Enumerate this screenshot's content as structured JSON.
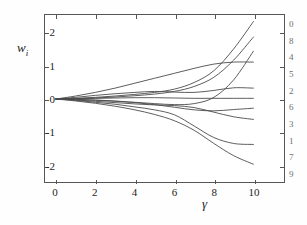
{
  "figure": {
    "background": "#ffffff",
    "frame_color": "#55565a",
    "curve_color": "#4a4a4a",
    "label_color": "#6d6e72"
  },
  "axes": {
    "x_title": "γ",
    "y_title_base": "w",
    "y_title_sub": "i",
    "x_ticks": [
      "0",
      "2",
      "4",
      "6",
      "8",
      "10"
    ],
    "x_tick_values": [
      0,
      2,
      4,
      6,
      8,
      10
    ],
    "y_ticks": [
      "2",
      "1",
      "0",
      "-1",
      "-2"
    ],
    "y_tick_values": [
      2,
      1,
      0,
      -1,
      -2
    ],
    "xlim": [
      -0.55,
      11.55
    ],
    "ylim": [
      -2.52,
      2.55
    ]
  },
  "chart_data": {
    "type": "line",
    "title": "",
    "xlabel": "γ",
    "ylabel": "w_i",
    "xlim": [
      -0.55,
      11.55
    ],
    "ylim": [
      -2.52,
      2.55
    ],
    "grid": false,
    "legend_position": "right-outside",
    "x": [
      0,
      1,
      2,
      3,
      4,
      5,
      6,
      7,
      8,
      9,
      10
    ],
    "series": [
      {
        "name": "0",
        "label": "0",
        "end_value": 2.35,
        "values": [
          0.0,
          0.02,
          0.05,
          0.09,
          0.14,
          0.2,
          0.3,
          0.5,
          0.86,
          1.52,
          2.35
        ]
      },
      {
        "name": "8",
        "label": "8",
        "end_value": 1.88,
        "values": [
          0.0,
          0.01,
          0.03,
          0.06,
          0.1,
          0.15,
          0.23,
          0.38,
          0.66,
          1.18,
          1.88
        ]
      },
      {
        "name": "4",
        "label": "4",
        "end_value": 1.45,
        "values": [
          0.0,
          -0.01,
          -0.03,
          -0.06,
          -0.1,
          -0.14,
          -0.17,
          -0.14,
          0.05,
          0.58,
          1.45
        ]
      },
      {
        "name": "5",
        "label": "5",
        "end_value": 1.12,
        "values": [
          0.0,
          0.09,
          0.2,
          0.33,
          0.48,
          0.63,
          0.78,
          0.93,
          1.06,
          1.12,
          1.12
        ]
      },
      {
        "name": "2",
        "label": "2",
        "end_value": 0.33,
        "values": [
          0.0,
          0.05,
          0.11,
          0.16,
          0.2,
          0.23,
          0.21,
          0.2,
          0.26,
          0.34,
          0.33
        ]
      },
      {
        "name": "6",
        "label": "6",
        "end_value": 0.02,
        "values": [
          0.0,
          0.01,
          0.02,
          0.03,
          0.04,
          0.04,
          0.03,
          0.02,
          0.02,
          0.02,
          0.02
        ]
      },
      {
        "name": "3",
        "label": "3",
        "end_value": -0.28,
        "values": [
          0.0,
          -0.02,
          -0.04,
          -0.07,
          -0.11,
          -0.17,
          -0.25,
          -0.33,
          -0.36,
          -0.32,
          -0.28
        ]
      },
      {
        "name": "1",
        "label": "1",
        "end_value": -0.62,
        "values": [
          0.0,
          -0.03,
          -0.07,
          -0.11,
          -0.15,
          -0.18,
          -0.2,
          -0.26,
          -0.4,
          -0.54,
          -0.62
        ]
      },
      {
        "name": "7",
        "label": "7",
        "end_value": -1.38,
        "values": [
          0.0,
          -0.04,
          -0.1,
          -0.16,
          -0.24,
          -0.33,
          -0.48,
          -0.82,
          -1.17,
          -1.35,
          -1.38
        ]
      },
      {
        "name": "9",
        "label": "9",
        "end_value": -1.98,
        "values": [
          0.0,
          -0.06,
          -0.13,
          -0.22,
          -0.33,
          -0.47,
          -0.66,
          -0.95,
          -1.35,
          -1.72,
          -1.98
        ]
      }
    ]
  }
}
